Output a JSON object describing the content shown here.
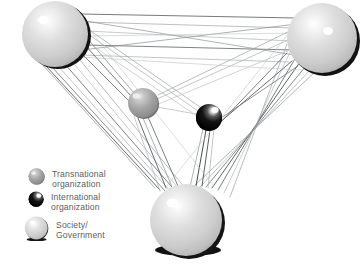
{
  "figure": {
    "kind": "network-diagram",
    "background_color": "#ffffff"
  },
  "palette": {
    "society_light": "#d9d9d9",
    "society_highlight": "#ffffff",
    "society_shadow": "#1a1a1a",
    "transnational_gray": "#9e9e9e",
    "transnational_highlight": "#e8e8e8",
    "international_black": "#0a0a0a",
    "international_highlight": "#f2f2f2",
    "edge_dark": "#4a4a4a",
    "edge_light": "#b3b3b3",
    "legend_text": "#5d5d5d"
  },
  "nodes": [
    {
      "id": "society-top-left",
      "type": "society",
      "label": "Society/Government",
      "cx": 55,
      "cy": 34,
      "r": 34
    },
    {
      "id": "society-top-right",
      "type": "society",
      "label": "Society/Government",
      "cx": 323,
      "cy": 38,
      "r": 37
    },
    {
      "id": "society-bottom",
      "type": "society",
      "label": "Society/Government",
      "cx": 186,
      "cy": 221,
      "r": 36
    },
    {
      "id": "transnational-1",
      "type": "transnational",
      "label": "Transnational organization",
      "cx": 143,
      "cy": 103,
      "r": 15
    },
    {
      "id": "international-1",
      "type": "international",
      "label": "International organization",
      "cx": 209,
      "cy": 117,
      "r": 13
    }
  ],
  "edges": {
    "description": "Dense multi-line ties between every pair of nodes; ties drawn as bundles of near-parallel thin lines in dark gray and light gray.",
    "bundles": [
      {
        "from": "society-top-left",
        "to": "society-top-right",
        "count": 7,
        "tone": "mixed"
      },
      {
        "from": "society-top-left",
        "to": "society-bottom",
        "count": 7,
        "tone": "mixed"
      },
      {
        "from": "society-top-right",
        "to": "society-bottom",
        "count": 7,
        "tone": "mixed"
      },
      {
        "from": "society-top-left",
        "to": "transnational-1",
        "count": 3,
        "tone": "dark"
      },
      {
        "from": "society-top-left",
        "to": "international-1",
        "count": 3,
        "tone": "light"
      },
      {
        "from": "society-top-right",
        "to": "transnational-1",
        "count": 3,
        "tone": "light"
      },
      {
        "from": "society-top-right",
        "to": "international-1",
        "count": 3,
        "tone": "dark"
      },
      {
        "from": "society-bottom",
        "to": "transnational-1",
        "count": 4,
        "tone": "mixed"
      },
      {
        "from": "society-bottom",
        "to": "international-1",
        "count": 4,
        "tone": "mixed"
      },
      {
        "from": "transnational-1",
        "to": "international-1",
        "count": 1,
        "tone": "light"
      }
    ]
  },
  "legend": {
    "items": [
      {
        "id": "legend-transnational",
        "swatch": "transnational-sphere-icon",
        "label": "Transnational\norganization"
      },
      {
        "id": "legend-international",
        "swatch": "international-sphere-icon",
        "label": "International\norganization"
      },
      {
        "id": "legend-society",
        "swatch": "society-sphere-icon",
        "label": "Society/\nGovernment"
      }
    ]
  }
}
